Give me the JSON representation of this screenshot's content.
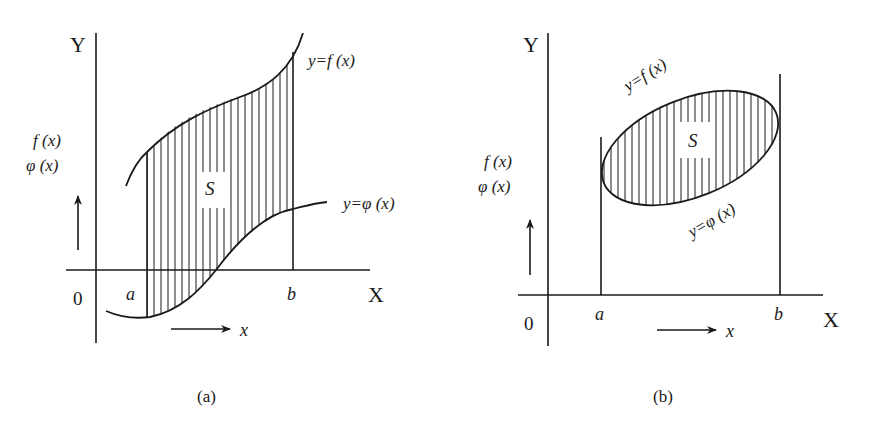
{
  "panels": [
    {
      "id": "a",
      "caption": "(a)",
      "axis_y_label": "Y",
      "axis_x_label": "X",
      "origin_label": "0",
      "left_label_line1": "f (x)",
      "left_label_line2": "φ (x)",
      "upper_curve_label": "y=f (x)",
      "lower_curve_label": "y=φ (x)",
      "region_label": "S",
      "bound_a": "a",
      "bound_b": "b",
      "direction_label": "x"
    },
    {
      "id": "b",
      "caption": "(b)",
      "axis_y_label": "Y",
      "axis_x_label": "X",
      "origin_label": "0",
      "left_label_line1": "f (x)",
      "left_label_line2": "φ (x)",
      "upper_curve_label": "y=f (x)",
      "lower_curve_label": "y=φ (x)",
      "region_label": "S",
      "bound_a": "a",
      "bound_b": "b",
      "direction_label": "x"
    }
  ],
  "colors": {
    "ink": "#1a1a1a",
    "background": "#ffffff"
  }
}
